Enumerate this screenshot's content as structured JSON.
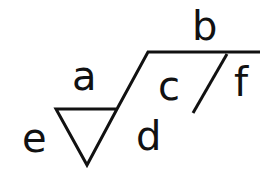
{
  "diagram": {
    "type": "surface-texture-symbol",
    "labels": {
      "a": "a",
      "b": "b",
      "c": "c",
      "d": "d",
      "e": "e",
      "f": "f"
    },
    "colors": {
      "stroke": "#111111",
      "background": "#ffffff"
    }
  }
}
